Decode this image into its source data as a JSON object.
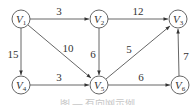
{
  "graph": {
    "type": "directed-weighted",
    "nodes": [
      {
        "id": "V1",
        "base": "V",
        "sub": "1",
        "x": 21,
        "y": 19
      },
      {
        "id": "V2",
        "base": "V",
        "sub": "2",
        "x": 99,
        "y": 19
      },
      {
        "id": "V3",
        "base": "V",
        "sub": "3",
        "x": 178,
        "y": 19
      },
      {
        "id": "V4",
        "base": "V",
        "sub": "4",
        "x": 21,
        "y": 85
      },
      {
        "id": "V5",
        "base": "V",
        "sub": "5",
        "x": 99,
        "y": 85
      },
      {
        "id": "V6",
        "base": "V",
        "sub": "6",
        "x": 180,
        "y": 85
      }
    ],
    "edges": [
      {
        "from": "V1",
        "to": "V2",
        "weight": "3"
      },
      {
        "from": "V2",
        "to": "V3",
        "weight": "12"
      },
      {
        "from": "V1",
        "to": "V4",
        "weight": "15"
      },
      {
        "from": "V1",
        "to": "V5",
        "weight": "10"
      },
      {
        "from": "V2",
        "to": "V5",
        "weight": "6"
      },
      {
        "from": "V5",
        "to": "V3",
        "weight": "5"
      },
      {
        "from": "V4",
        "to": "V5",
        "weight": "3"
      },
      {
        "from": "V5",
        "to": "V6",
        "weight": "6"
      },
      {
        "from": "V6",
        "to": "V3",
        "weight": "7"
      }
    ]
  },
  "labels": {
    "V1": {
      "base": "V",
      "sub": "1"
    },
    "V2": {
      "base": "V",
      "sub": "2"
    },
    "V3": {
      "base": "V",
      "sub": "3"
    },
    "V4": {
      "base": "V",
      "sub": "4"
    },
    "V5": {
      "base": "V",
      "sub": "5"
    },
    "V6": {
      "base": "V",
      "sub": "6"
    },
    "e12": "3",
    "e23": "12",
    "e14": "15",
    "e15": "10",
    "e25": "6",
    "e53": "5",
    "e45": "3",
    "e56": "6",
    "e63": "7"
  },
  "caption": "图 — 有向网示例"
}
